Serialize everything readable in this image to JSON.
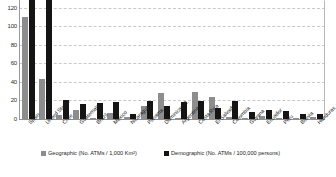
{
  "chart_data": {
    "type": "bar",
    "title": "",
    "xlabel": "",
    "ylabel": "",
    "ylim": [
      0,
      120
    ],
    "yticks": [
      0,
      20,
      40,
      60,
      80,
      100,
      120
    ],
    "grid": true,
    "legend_position": "bottom",
    "note": "Spain's demographic bar is clipped at the top of the plot area (value exceeds the 120 axis maximum).",
    "categories": [
      "Spain",
      "United States",
      "Chile",
      "Guatemala",
      "Brazil",
      "Mexico",
      "Nicaragua",
      "Panama",
      "Dominican R.",
      "Argentina",
      "Costa Rica",
      "El Salvador",
      "Colombia",
      "Guyana",
      "Ecuador",
      "Peru",
      "Bolivia",
      "Honduras"
    ],
    "series": [
      {
        "name": "Geographic (No. ATMs / 1,000 Km²)",
        "color": "#8d8d8d",
        "values": [
          103,
          40,
          4,
          9,
          1.5,
          6,
          2,
          13,
          26,
          1,
          27,
          22,
          2,
          0.4,
          3,
          0.8,
          0.3,
          2
        ]
      },
      {
        "name": "Demographic (No. ATMs / 100,000 persons)",
        "color": "#141414",
        "values": [
          127,
          120,
          19,
          15,
          16,
          17,
          5,
          18,
          13,
          17,
          18,
          11,
          18,
          7,
          9,
          8,
          5,
          5
        ]
      }
    ],
    "legend": [
      "Geographic (No. ATMs / 1,000 Km²)",
      "Demographic (No. ATMs / 100,000 persons)"
    ]
  }
}
